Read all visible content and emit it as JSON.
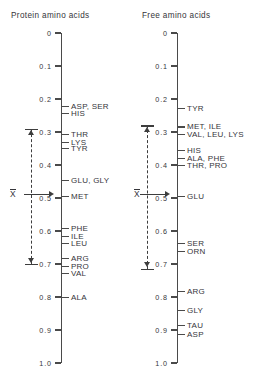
{
  "figure": {
    "axis_label_top": "0",
    "axis_label_bottom": "1.0",
    "mean_symbol": "X"
  },
  "chart_data": {
    "type": "scatter",
    "title": "",
    "orientation": "vertical-dual-scale",
    "ylabel": "",
    "xlabel": "",
    "ylim": [
      0,
      1.0
    ],
    "y_inverted": true,
    "grid": false,
    "legend": null,
    "axis_ticks": [
      "0",
      "0.1",
      "0.2",
      "0.3",
      "0.4",
      "0.5",
      "0.6",
      "0.7",
      "0.8",
      "0.9",
      "1.0"
    ],
    "axis_tick_values": [
      0,
      0.1,
      0.2,
      0.3,
      0.4,
      0.5,
      0.6,
      0.7,
      0.8,
      0.9,
      1.0
    ],
    "panels": [
      {
        "key": "protein",
        "title": "Protein amino acids",
        "mean": 0.49,
        "range_low": 0.29,
        "range_high": 0.7,
        "points": [
          {
            "label": "ASP, SER",
            "value": 0.222
          },
          {
            "label": "HIS",
            "value": 0.243
          },
          {
            "label": "THR",
            "value": 0.307
          },
          {
            "label": "LYS",
            "value": 0.331
          },
          {
            "label": "TYR",
            "value": 0.35
          },
          {
            "label": "GLU, GLY",
            "value": 0.447
          },
          {
            "label": "MET",
            "value": 0.495
          },
          {
            "label": "PHE",
            "value": 0.592
          },
          {
            "label": "ILE",
            "value": 0.616
          },
          {
            "label": "LEU",
            "value": 0.638
          },
          {
            "label": "ARG",
            "value": 0.683
          },
          {
            "label": "PRO",
            "value": 0.707
          },
          {
            "label": "VAL",
            "value": 0.728
          },
          {
            "label": "ALA",
            "value": 0.801
          }
        ]
      },
      {
        "key": "free",
        "title": "Free amino acids",
        "mean": 0.49,
        "range_low": 0.28,
        "range_high": 0.715,
        "points": [
          {
            "label": "TYR",
            "value": 0.228
          },
          {
            "label": "MET, ILE",
            "value": 0.285
          },
          {
            "label": "VAL, LEU, LYS",
            "value": 0.307
          },
          {
            "label": "HIS",
            "value": 0.355
          },
          {
            "label": "ALA, PHE",
            "value": 0.38
          },
          {
            "label": "THR, PRO",
            "value": 0.401
          },
          {
            "label": "GLU",
            "value": 0.495
          },
          {
            "label": "SER",
            "value": 0.638
          },
          {
            "label": "ORN",
            "value": 0.662
          },
          {
            "label": "ARG",
            "value": 0.783
          },
          {
            "label": "GLY",
            "value": 0.841
          },
          {
            "label": "TAU",
            "value": 0.886
          },
          {
            "label": "ASP",
            "value": 0.913
          }
        ]
      }
    ]
  }
}
